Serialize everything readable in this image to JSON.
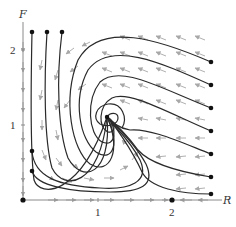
{
  "diagram": {
    "type": "phase-portrait",
    "axes": {
      "x_label": "R",
      "y_label": "F",
      "x_ticks": [
        {
          "value": 1,
          "label": "1"
        },
        {
          "value": 2,
          "label": "2"
        }
      ],
      "y_ticks": [
        {
          "value": 1,
          "label": "1"
        },
        {
          "value": 2,
          "label": "2"
        }
      ]
    },
    "equilibria": [
      {
        "name": "origin",
        "R": 0,
        "F": 0
      },
      {
        "name": "prey-only",
        "R": 2,
        "F": 0
      },
      {
        "name": "spiral-sink",
        "R": 1.13,
        "F": 1.1
      }
    ],
    "colors": {
      "trajectory": "#2a2a2a",
      "field_arrow": "#a8a8a8",
      "axis": "#8a8a8a",
      "dot": "#111111"
    }
  }
}
